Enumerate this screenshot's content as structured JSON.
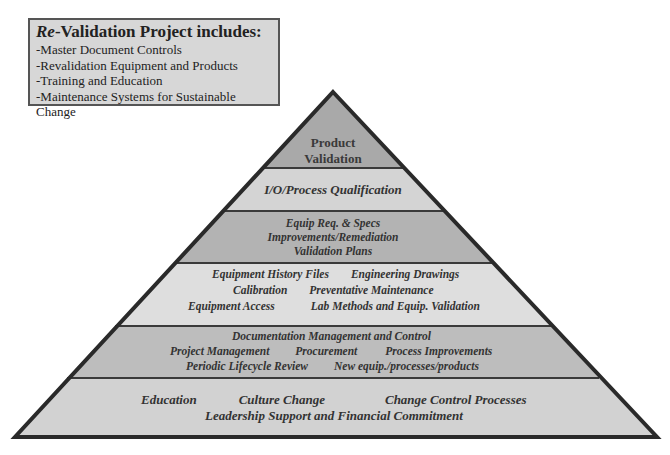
{
  "info_box": {
    "title_prefix": "Re",
    "title_rest": "-Validation Project includes:",
    "items": [
      "-Master Document Controls",
      "-Revalidation Equipment and Products",
      "-Training and Education",
      "-Maintenance Systems for Sustainable Change"
    ]
  },
  "pyramid": {
    "colors": {
      "layer1": "#a9a9a9",
      "layer2": "#d4d4d4",
      "layer3": "#b3b3b3",
      "layer4": "#dedede",
      "layer5": "#bdbdbd",
      "layer6": "#d2d2d2",
      "outline": "#2a2a2a"
    },
    "layers": [
      {
        "name": "apex",
        "lines": [
          [
            "Product"
          ],
          [
            "Validation"
          ]
        ]
      },
      {
        "name": "io-process",
        "lines": [
          [
            "I/O/Process Qualification"
          ]
        ]
      },
      {
        "name": "equip-req",
        "lines": [
          [
            "Equip Req. & Specs"
          ],
          [
            "Improvements/Remediation"
          ],
          [
            "Validation Plans"
          ]
        ]
      },
      {
        "name": "equipment",
        "lines": [
          [
            "Equipment History Files",
            "Engineering Drawings"
          ],
          [
            "Calibration",
            "Preventative Maintenance"
          ],
          [
            "Equipment Access",
            "Lab Methods and Equip. Validation"
          ]
        ]
      },
      {
        "name": "documentation",
        "lines": [
          [
            "Documentation Management and Control"
          ],
          [
            "Project Management",
            "Procurement",
            "Process Improvements"
          ],
          [
            "Periodic Lifecycle Review",
            "New equip./processes/products"
          ]
        ]
      },
      {
        "name": "foundation",
        "lines": [
          [
            "Education",
            "Culture Change",
            "Change Control Processes"
          ],
          [
            "Leadership Support and Financial Commitment"
          ]
        ]
      }
    ]
  }
}
